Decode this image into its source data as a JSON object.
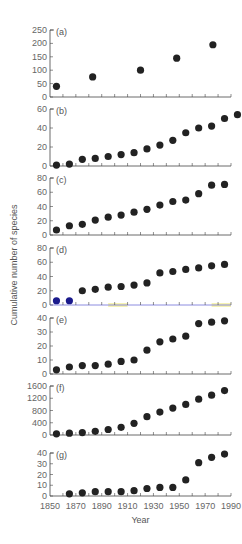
{
  "figure": {
    "xlabel": "Year",
    "ylabel": "Cumulative number of species",
    "x_ticks": [
      1850,
      1870,
      1890,
      1910,
      1930,
      1950,
      1970,
      1990
    ]
  },
  "chart_data": [
    {
      "type": "scatter",
      "panel": "(a)",
      "xlabel": "",
      "ylabel": "Cumulative number of species",
      "ylim": [
        0,
        250
      ],
      "y_ticks": [
        0,
        50,
        100,
        150,
        200,
        250
      ],
      "x": [
        1855,
        1883,
        1920,
        1948,
        1976
      ],
      "values": [
        40,
        75,
        100,
        145,
        195
      ],
      "point_color": "#222222"
    },
    {
      "type": "scatter",
      "panel": "(b)",
      "ylim": [
        0,
        60
      ],
      "y_ticks": [
        0,
        20,
        40,
        60
      ],
      "x": [
        1855,
        1865,
        1875,
        1885,
        1895,
        1905,
        1915,
        1925,
        1935,
        1945,
        1955,
        1965,
        1975,
        1985,
        1995
      ],
      "values": [
        1,
        2,
        7,
        8,
        10,
        12,
        14,
        18,
        22,
        27,
        35,
        40,
        42,
        50,
        54
      ],
      "point_color": "#222222"
    },
    {
      "type": "scatter",
      "panel": "(c)",
      "ylim": [
        0,
        80
      ],
      "y_ticks": [
        0,
        20,
        40,
        60,
        80
      ],
      "x": [
        1855,
        1865,
        1875,
        1885,
        1895,
        1905,
        1915,
        1925,
        1935,
        1945,
        1955,
        1965,
        1975,
        1985
      ],
      "values": [
        7,
        13,
        15,
        21,
        25,
        28,
        32,
        36,
        42,
        47,
        49,
        58,
        70,
        71
      ],
      "point_color": "#222222"
    },
    {
      "type": "scatter",
      "panel": "(d)",
      "ylim": [
        0,
        80
      ],
      "y_ticks": [
        0,
        20,
        40,
        60,
        80
      ],
      "x": [
        1855,
        1865,
        1875,
        1885,
        1895,
        1905,
        1915,
        1925,
        1935,
        1945,
        1955,
        1965,
        1975,
        1985
      ],
      "values": [
        6,
        6,
        20,
        22,
        25,
        26,
        28,
        31,
        45,
        47,
        50,
        52,
        55,
        57
      ],
      "point_colors": [
        "#1a1a8c",
        "#1a1a8c",
        "#222222",
        "#222222",
        "#222222",
        "#222222",
        "#222222",
        "#222222",
        "#222222",
        "#222222",
        "#222222",
        "#222222",
        "#222222",
        "#222222"
      ],
      "axis_color": "#6f6fd8",
      "highlights": [
        {
          "x_from": 1895,
          "x_to": 1910,
          "color": "#f4f0a0"
        },
        {
          "x_from": 1975,
          "x_to": 1990,
          "color": "#f4f0a0"
        }
      ]
    },
    {
      "type": "scatter",
      "panel": "(e)",
      "ylim": [
        0,
        40
      ],
      "y_ticks": [
        0,
        10,
        20,
        30,
        40
      ],
      "x": [
        1855,
        1865,
        1875,
        1885,
        1895,
        1905,
        1915,
        1925,
        1935,
        1945,
        1955,
        1965,
        1975,
        1985
      ],
      "values": [
        3,
        5,
        6,
        6,
        7,
        9,
        10,
        17,
        23,
        25,
        27,
        36,
        37,
        38
      ],
      "point_color": "#222222"
    },
    {
      "type": "scatter",
      "panel": "(f)",
      "ylim": [
        0,
        1600
      ],
      "y_ticks": [
        0,
        400,
        800,
        1200,
        1600
      ],
      "x": [
        1855,
        1865,
        1875,
        1885,
        1895,
        1905,
        1915,
        1925,
        1935,
        1945,
        1955,
        1965,
        1975,
        1985
      ],
      "values": [
        40,
        60,
        80,
        120,
        180,
        250,
        380,
        600,
        750,
        880,
        1000,
        1170,
        1300,
        1450
      ],
      "point_color": "#222222"
    },
    {
      "type": "scatter",
      "panel": "(g)",
      "xlabel": "Year",
      "ylim": [
        0,
        40
      ],
      "y_ticks": [
        0,
        10,
        20,
        30,
        40
      ],
      "x": [
        1865,
        1875,
        1885,
        1895,
        1905,
        1915,
        1925,
        1935,
        1945,
        1955,
        1965,
        1975,
        1985
      ],
      "values": [
        2,
        3,
        4,
        4,
        4,
        5,
        7,
        8,
        8,
        15,
        31,
        36,
        39
      ],
      "point_color": "#222222"
    }
  ]
}
